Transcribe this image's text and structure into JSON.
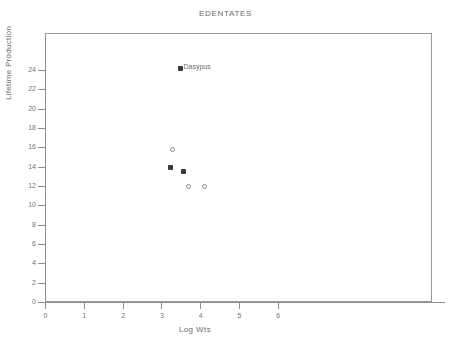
{
  "chart_data": {
    "type": "scatter",
    "title": "EDENTATES",
    "xlabel": "Log  Wts",
    "ylabel": "Lifetime Production",
    "xlim": [
      0,
      6.8
    ],
    "ylim": [
      0,
      26.5
    ],
    "grid": false,
    "legend": "none",
    "xticks": [
      0,
      1,
      2,
      3,
      4,
      5,
      6
    ],
    "xticklabels": [
      "0",
      "1",
      "2",
      "3",
      "4",
      "5",
      "6"
    ],
    "yticks": [
      0,
      2,
      4,
      6,
      8,
      10,
      12,
      14,
      16,
      18,
      20,
      22,
      24
    ],
    "yticklabels": [
      "0",
      "2",
      "4",
      "6",
      "8",
      "10",
      "12",
      "14",
      "16",
      "18",
      "20",
      "22",
      "24"
    ],
    "points": [
      {
        "x": 3.48,
        "y": 24.2,
        "marker": "filled",
        "label": "Dasypus"
      },
      {
        "x": 3.28,
        "y": 15.8,
        "marker": "open",
        "label": ""
      },
      {
        "x": 3.24,
        "y": 13.9,
        "marker": "filled",
        "label": ""
      },
      {
        "x": 3.58,
        "y": 13.45,
        "marker": "filled",
        "label": ""
      },
      {
        "x": 3.69,
        "y": 11.9,
        "marker": "open",
        "label": ""
      },
      {
        "x": 4.11,
        "y": 11.9,
        "marker": "open",
        "label": ""
      }
    ],
    "annotations": [
      {
        "text": "Dasypus",
        "x": 3.48,
        "y": 24.2
      }
    ],
    "colors": {
      "filled_marker": "#3a3a3a",
      "open_marker": "#8a8a8a",
      "axis": "#8d8d8d",
      "text": "#6b6b6b",
      "background": "#ffffff"
    }
  }
}
